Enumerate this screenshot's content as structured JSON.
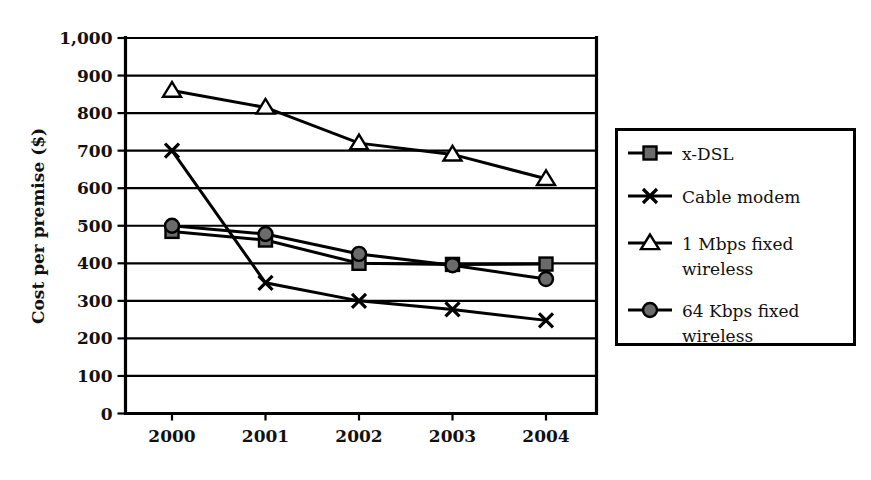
{
  "chart_data": {
    "type": "line",
    "title": "",
    "xlabel": "",
    "ylabel": "Cost per premise ($)",
    "categories": [
      "2000",
      "2001",
      "2002",
      "2003",
      "2004"
    ],
    "x": [
      2000,
      2001,
      2002,
      2003,
      2004
    ],
    "ylim": [
      0,
      1000
    ],
    "ytick_step": 100,
    "ytick_labels": [
      "1,000",
      "900",
      "800",
      "700",
      "600",
      "500",
      "400",
      "300",
      "200",
      "100",
      "0"
    ],
    "ytick_values": [
      1000,
      900,
      800,
      700,
      600,
      500,
      400,
      300,
      200,
      100,
      0
    ],
    "grid": "horizontal",
    "legend_position": "right-outside",
    "series": [
      {
        "name": "x-DSL",
        "marker": "square",
        "marker_fill": "#6b6b6b",
        "values": [
          485,
          462,
          400,
          397,
          398
        ]
      },
      {
        "name": "Cable modem",
        "marker": "x",
        "marker_fill": "#000000",
        "values": [
          700,
          348,
          300,
          277,
          248
        ]
      },
      {
        "name": "1 Mbps fixed wireless",
        "marker": "triangle",
        "marker_fill": "#ffffff",
        "values": [
          860,
          815,
          720,
          690,
          625
        ]
      },
      {
        "name": "64 Kbps fixed wireless",
        "marker": "circle",
        "marker_fill": "#6b6b6b",
        "values": [
          500,
          478,
          425,
          395,
          358
        ]
      }
    ]
  },
  "legend": {
    "entries": [
      {
        "label_line1": "x-DSL",
        "label_line2": ""
      },
      {
        "label_line1": "Cable modem",
        "label_line2": ""
      },
      {
        "label_line1": "1 Mbps fixed",
        "label_line2": "wireless"
      },
      {
        "label_line1": "64 Kbps fixed",
        "label_line2": "wireless"
      }
    ]
  },
  "colors": {
    "axis": "#000000",
    "grid": "#000000",
    "marker_gray": "#6b6b6b",
    "background": "#ffffff"
  }
}
